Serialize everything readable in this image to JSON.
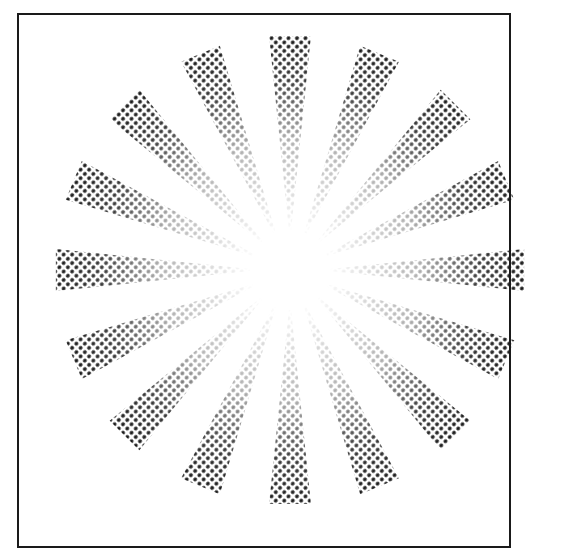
{
  "figure": {
    "ray_count": 16,
    "center": [
      290,
      270
    ],
    "inner_radius": 40,
    "outer_radius": 235,
    "colors": {
      "ink": "#1a1a1a",
      "paper": "#ffffff",
      "border": "#1a1a1a"
    }
  }
}
